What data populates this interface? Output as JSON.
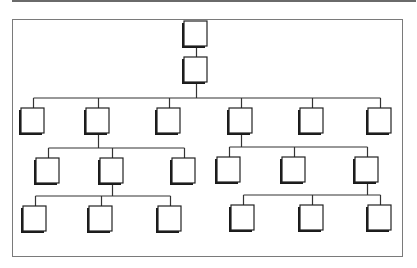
{
  "diagram": {
    "type": "org-chart",
    "colors": {
      "line": "#333333",
      "node_fill": "#ffffff",
      "node_border": "#222222",
      "shadow": "#1a1a1a",
      "frame": "#7a7a7a"
    },
    "node_size": {
      "w": 23,
      "h": 25
    },
    "nodes": [
      {
        "id": "n0",
        "level": 0,
        "x": 184,
        "y": 21
      },
      {
        "id": "n1",
        "level": 1,
        "x": 184,
        "y": 57
      },
      {
        "id": "a1",
        "level": 2,
        "x": 21,
        "y": 108
      },
      {
        "id": "a2",
        "level": 2,
        "x": 86,
        "y": 108
      },
      {
        "id": "a3",
        "level": 2,
        "x": 157,
        "y": 108
      },
      {
        "id": "a4",
        "level": 2,
        "x": 229,
        "y": 108
      },
      {
        "id": "a5",
        "level": 2,
        "x": 300,
        "y": 108
      },
      {
        "id": "a6",
        "level": 2,
        "x": 368,
        "y": 108
      },
      {
        "id": "b1",
        "level": 3,
        "x": 36,
        "y": 158
      },
      {
        "id": "b2",
        "level": 3,
        "x": 100,
        "y": 158
      },
      {
        "id": "b3",
        "level": 3,
        "x": 172,
        "y": 158
      },
      {
        "id": "b4",
        "level": 3,
        "x": 217,
        "y": 157
      },
      {
        "id": "b5",
        "level": 3,
        "x": 282,
        "y": 157
      },
      {
        "id": "b6",
        "level": 3,
        "x": 355,
        "y": 157
      },
      {
        "id": "c1",
        "level": 4,
        "x": 23,
        "y": 206
      },
      {
        "id": "c2",
        "level": 4,
        "x": 89,
        "y": 206
      },
      {
        "id": "c3",
        "level": 4,
        "x": 158,
        "y": 206
      },
      {
        "id": "c4",
        "level": 4,
        "x": 231,
        "y": 205
      },
      {
        "id": "c5",
        "level": 4,
        "x": 300,
        "y": 205
      },
      {
        "id": "c6",
        "level": 4,
        "x": 368,
        "y": 205
      }
    ],
    "edges": [
      {
        "from": "n0",
        "to": "n1"
      },
      {
        "from": "n1",
        "to": "a1"
      },
      {
        "from": "n1",
        "to": "a2"
      },
      {
        "from": "n1",
        "to": "a3"
      },
      {
        "from": "n1",
        "to": "a4"
      },
      {
        "from": "n1",
        "to": "a5"
      },
      {
        "from": "n1",
        "to": "a6"
      },
      {
        "from": "a2",
        "to": "b1"
      },
      {
        "from": "a2",
        "to": "b2"
      },
      {
        "from": "a2",
        "to": "b3"
      },
      {
        "from": "a4",
        "to": "b4"
      },
      {
        "from": "a4",
        "to": "b5"
      },
      {
        "from": "a4",
        "to": "b6"
      },
      {
        "from": "b2",
        "to": "c1"
      },
      {
        "from": "b2",
        "to": "c2"
      },
      {
        "from": "b2",
        "to": "c3"
      },
      {
        "from": "b6",
        "to": "c4"
      },
      {
        "from": "b6",
        "to": "c5"
      },
      {
        "from": "b6",
        "to": "c6"
      }
    ]
  }
}
